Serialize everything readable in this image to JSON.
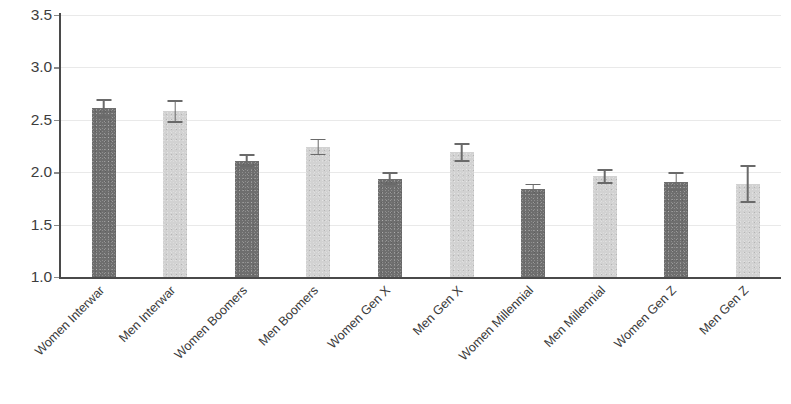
{
  "chart_data": {
    "type": "bar",
    "title": "",
    "subtitle": "",
    "xlabel": "",
    "ylabel": "",
    "ylim": [
      1.0,
      3.5
    ],
    "ytick_labels": [
      "3.5",
      "3.0",
      "2.5",
      "2.0",
      "1.5",
      "1.0"
    ],
    "ytick_values": [
      3.5,
      3.0,
      2.5,
      2.0,
      1.5,
      1.0
    ],
    "grid": true,
    "grid_axis": "y",
    "legend": "none",
    "error_bars": "symmetric",
    "categories": [
      "Women Interwar",
      "Men Interwar",
      "Women Boomers",
      "Men Boomers",
      "Women Gen X",
      "Men Gen X",
      "Women Millennial",
      "Men Millennial",
      "Women Gen Z",
      "Men Gen Z"
    ],
    "values": [
      2.61,
      2.58,
      2.11,
      2.24,
      1.94,
      2.19,
      1.84,
      1.96,
      1.91,
      1.89
    ],
    "errors": [
      0.09,
      0.11,
      0.06,
      0.08,
      0.06,
      0.09,
      0.05,
      0.07,
      0.09,
      0.18
    ],
    "bar_colors": [
      "#6e6e6e",
      "#d2d2d2",
      "#6e6e6e",
      "#d2d2d2",
      "#6e6e6e",
      "#d2d2d2",
      "#6e6e6e",
      "#d2d2d2",
      "#6e6e6e",
      "#d2d2d2"
    ],
    "series": [
      {
        "name": "Mean score",
        "values": [
          2.61,
          2.58,
          2.11,
          2.24,
          1.94,
          2.19,
          1.84,
          1.96,
          1.91,
          1.89
        ],
        "errors": [
          0.09,
          0.11,
          0.06,
          0.08,
          0.06,
          0.09,
          0.05,
          0.07,
          0.09,
          0.18
        ]
      }
    ],
    "colors": {
      "women_bar": "#6e6e6e",
      "men_bar": "#d2d2d2",
      "axis": "#4a4a4a",
      "gridline": "#e9e9e9",
      "error_bar": "#6a6a6a",
      "text": "#3a3a3a",
      "background": "#ffffff"
    }
  }
}
